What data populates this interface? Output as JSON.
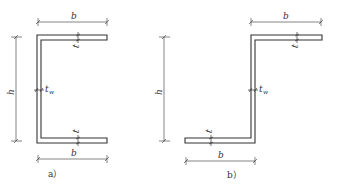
{
  "figures": [
    {
      "id": "a",
      "caption": "a）",
      "section_type": "channel",
      "labels": {
        "top_width": "b",
        "bottom_width": "b",
        "height": "h",
        "web_thickness": "t",
        "web_thickness_sub": "w",
        "flange_thickness_top": "t",
        "flange_thickness_bottom": "t"
      }
    },
    {
      "id": "b",
      "caption": "b）",
      "section_type": "z-section",
      "labels": {
        "top_width": "b",
        "bottom_width": "b",
        "height": "h",
        "web_thickness": "t",
        "web_thickness_sub": "w",
        "flange_thickness_top": "t",
        "flange_thickness_bottom": "t"
      }
    }
  ],
  "colors": {
    "line": "#333333",
    "background": "#ffffff"
  }
}
